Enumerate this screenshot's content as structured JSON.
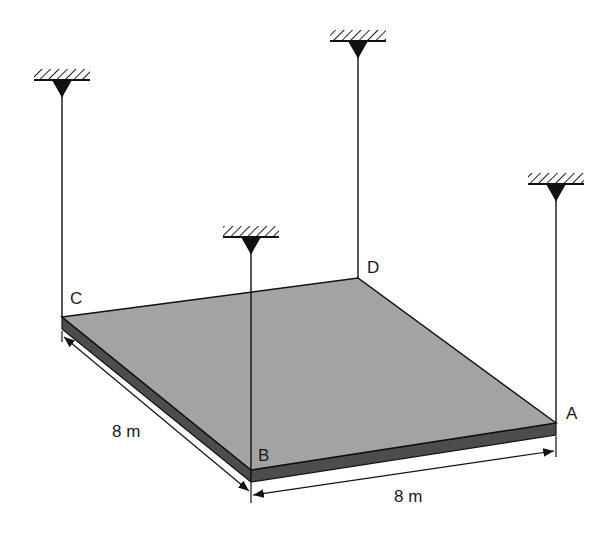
{
  "diagram": {
    "title": "",
    "plate": {
      "fill_top": "#a3a3a3",
      "fill_edge": "#4d4d4d",
      "corners": {
        "C": [
          62,
          317
        ],
        "D": [
          358,
          278
        ],
        "A": [
          556,
          423
        ],
        "B": [
          251,
          470
        ]
      },
      "thickness": 12
    },
    "points": [
      {
        "id": "C",
        "label": "C",
        "x": 70,
        "y": 290
      },
      {
        "id": "D",
        "label": "D",
        "x": 367,
        "y": 259
      },
      {
        "id": "B",
        "label": "B",
        "x": 258,
        "y": 447
      },
      {
        "id": "A",
        "label": "A",
        "x": 566,
        "y": 405
      }
    ],
    "supports": [
      {
        "id": "support-C",
        "x": 62,
        "y_ceiling": 80,
        "y_end": 317
      },
      {
        "id": "support-D",
        "x": 358,
        "y_ceiling": 41,
        "y_end": 278
      },
      {
        "id": "support-B",
        "x": 251,
        "y_ceiling": 237,
        "y_end": 470
      },
      {
        "id": "support-A",
        "x": 556,
        "y_ceiling": 184,
        "y_end": 423
      }
    ],
    "dimensions": [
      {
        "id": "dim-CB",
        "label": "8 m",
        "label_x": 112,
        "label_y": 423
      },
      {
        "id": "dim-BA",
        "label": "8 m",
        "label_x": 394,
        "label_y": 488
      }
    ]
  }
}
